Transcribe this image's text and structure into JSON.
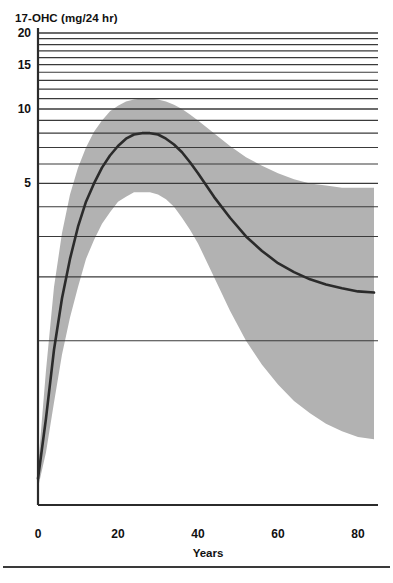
{
  "figure": {
    "background_color": "#ffffff",
    "band_color": "#b2b2b2",
    "curve_color": "#2b2b2b",
    "grid_color": "#3a3a3a",
    "axis_color": "#2b2b2b",
    "bottom_rule_color": "#3a3a3a",
    "cropped_caption_above": "",
    "y_axis_unit_label": "17-OHC (mg/24 hr)",
    "x_axis_title": "Years"
  },
  "chart_data": {
    "type": "line",
    "title": "",
    "subtitle": "",
    "xlabel": "Years",
    "ylabel": "17-OHC (mg/24 hr)",
    "ylabel_note": "17-OHC (mg/24 hr)",
    "y_scale": "log-like (gridline spacing increases downward)",
    "xlim": [
      0,
      85
    ],
    "ylim": [
      0,
      20
    ],
    "xticks": [
      0,
      20,
      40,
      60,
      80
    ],
    "xtick_labels": [
      "0",
      "20",
      "40",
      "60",
      "80"
    ],
    "yticks": [
      5,
      10,
      15,
      20
    ],
    "ytick_labels": [
      "5",
      "10",
      "15",
      "20"
    ],
    "gridlines_y": [
      1,
      2,
      3,
      4,
      5,
      6,
      7,
      8,
      9,
      10,
      11,
      12,
      13,
      14,
      15,
      16,
      17,
      18,
      19,
      20
    ],
    "grid": true,
    "grid_axis": "y",
    "legend": false,
    "legend_position": "none",
    "annotations": [],
    "series": [
      {
        "name": "17-OHC mean",
        "role": "central-curve",
        "color": "#2b2b2b",
        "x": [
          0,
          2,
          4,
          6,
          8,
          10,
          12,
          14,
          16,
          18,
          20,
          22,
          24,
          26,
          28,
          30,
          32,
          34,
          36,
          38,
          40,
          44,
          48,
          52,
          56,
          60,
          64,
          68,
          72,
          76,
          80,
          84
        ],
        "values": [
          0.08,
          0.35,
          0.9,
          1.6,
          2.4,
          3.3,
          4.2,
          5.0,
          5.8,
          6.5,
          7.1,
          7.6,
          7.9,
          8.0,
          8.0,
          7.9,
          7.6,
          7.2,
          6.7,
          6.1,
          5.5,
          4.4,
          3.6,
          3.0,
          2.6,
          2.3,
          2.1,
          1.95,
          1.85,
          1.78,
          1.72,
          1.7
        ]
      },
      {
        "name": "17-OHC upper bound",
        "role": "band-upper",
        "color": "#b2b2b2",
        "x": [
          0,
          2,
          4,
          6,
          8,
          10,
          12,
          14,
          16,
          18,
          20,
          22,
          24,
          26,
          28,
          30,
          32,
          34,
          36,
          38,
          40,
          44,
          48,
          52,
          56,
          60,
          64,
          68,
          72,
          76,
          80,
          84
        ],
        "values": [
          0.12,
          0.7,
          1.8,
          3.1,
          4.5,
          5.8,
          7.0,
          8.1,
          9.0,
          9.8,
          10.3,
          10.7,
          10.9,
          11.0,
          11.0,
          10.9,
          10.7,
          10.4,
          10.0,
          9.5,
          9.0,
          8.0,
          7.1,
          6.4,
          5.9,
          5.5,
          5.2,
          5.0,
          4.9,
          4.8,
          4.8,
          4.8
        ]
      },
      {
        "name": "17-OHC lower bound",
        "role": "band-lower",
        "color": "#b2b2b2",
        "x": [
          0,
          2,
          4,
          6,
          8,
          10,
          12,
          14,
          16,
          18,
          20,
          22,
          24,
          26,
          28,
          30,
          32,
          34,
          36,
          38,
          40,
          44,
          48,
          52,
          56,
          60,
          64,
          68,
          72,
          76,
          80,
          84
        ],
        "values": [
          0.05,
          0.18,
          0.45,
          0.85,
          1.3,
          1.8,
          2.4,
          2.9,
          3.4,
          3.8,
          4.2,
          4.4,
          4.6,
          4.6,
          4.6,
          4.5,
          4.3,
          4.0,
          3.6,
          3.2,
          2.8,
          2.0,
          1.4,
          1.0,
          0.75,
          0.58,
          0.46,
          0.38,
          0.32,
          0.28,
          0.25,
          0.24
        ]
      }
    ]
  }
}
